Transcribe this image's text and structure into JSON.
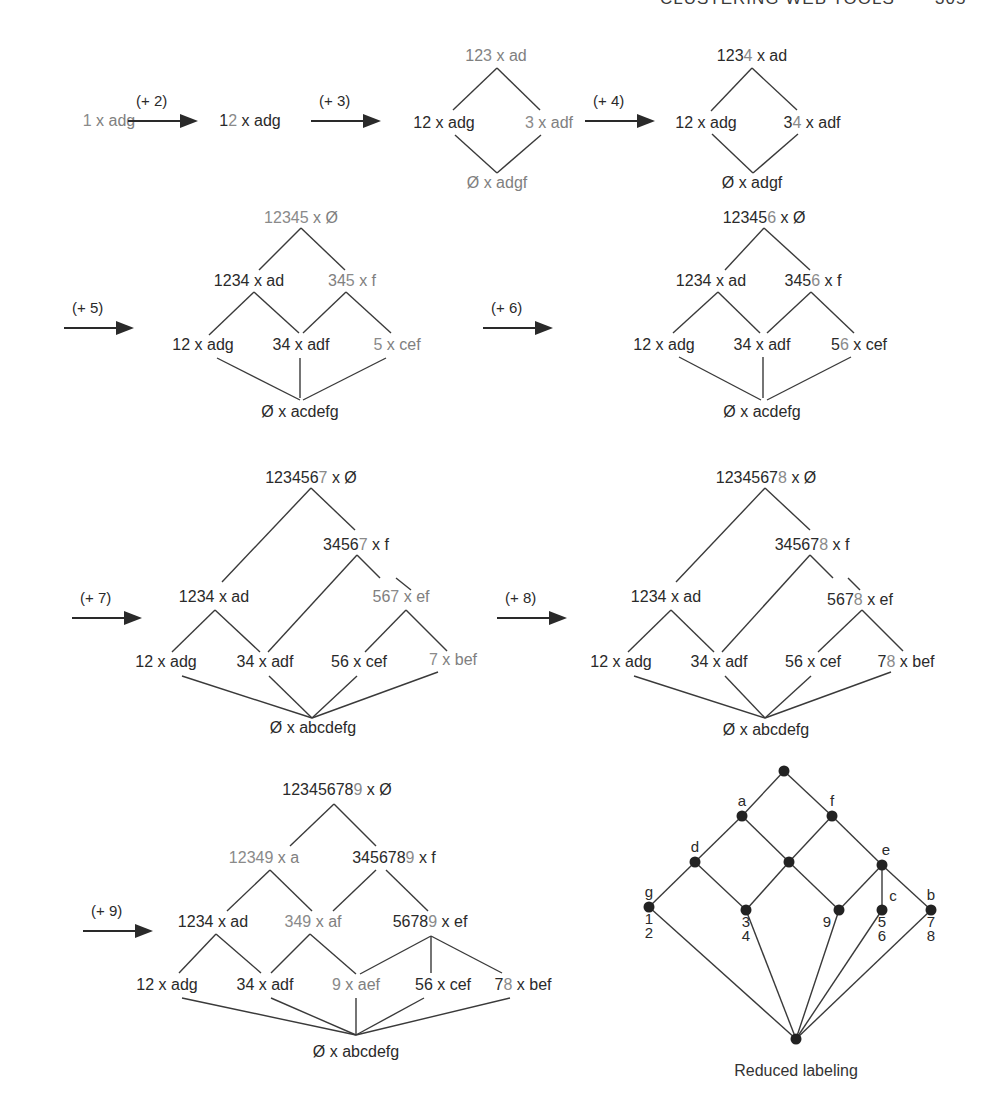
{
  "running_head": {
    "title": "CLUSTERING WEB TOOLS",
    "page": "305"
  },
  "steps": [
    {
      "id": "s1",
      "arrow": null,
      "nodes": [
        {
          "id": "n1",
          "pre": "",
          "new": "1",
          "post": " x adg",
          "x": 109,
          "y": 121,
          "gray": true
        }
      ],
      "edges": []
    },
    {
      "id": "s2",
      "arrow": {
        "label": "(+ 2)",
        "x": 128,
        "y": 111,
        "w": 70
      },
      "nodes": [
        {
          "id": "n1",
          "pre": "1",
          "new": "2",
          "post": " x adg",
          "x": 250,
          "y": 121
        }
      ],
      "edges": []
    },
    {
      "id": "s3",
      "arrow": {
        "label": "(+ 3)",
        "x": 311,
        "y": 111,
        "w": 70
      },
      "nodes": [
        {
          "id": "top",
          "pre": "12",
          "new": "3",
          "post": " x ad",
          "x": 496,
          "y": 56,
          "gray": true
        },
        {
          "id": "l",
          "pre": "",
          "new": "",
          "post": "12 x adg",
          "x": 444,
          "y": 123
        },
        {
          "id": "r",
          "pre": "",
          "new": "3",
          "post": " x adf",
          "x": 549,
          "y": 123,
          "gray": true
        },
        {
          "id": "bot",
          "pre": "",
          "new": "",
          "post": "Ø x adgf",
          "x": 497,
          "y": 183,
          "gray": true
        }
      ],
      "edges": [
        [
          453,
          110,
          497,
          68
        ],
        [
          497,
          68,
          540,
          110
        ],
        [
          455,
          135,
          497,
          173
        ],
        [
          497,
          173,
          541,
          135
        ]
      ]
    },
    {
      "id": "s4",
      "arrow": {
        "label": "(+ 4)",
        "x": 585,
        "y": 111,
        "w": 70
      },
      "nodes": [
        {
          "id": "top",
          "pre": "123",
          "new": "4",
          "post": " x ad",
          "x": 752,
          "y": 56
        },
        {
          "id": "l",
          "pre": "",
          "new": "",
          "post": "12 x adg",
          "x": 706,
          "y": 123
        },
        {
          "id": "r",
          "pre": "3",
          "new": "4",
          "post": " x adf",
          "x": 812,
          "y": 123
        },
        {
          "id": "bot",
          "pre": "",
          "new": "",
          "post": "Ø x adgf",
          "x": 752,
          "y": 183
        }
      ],
      "edges": [
        [
          711,
          111,
          752,
          68
        ],
        [
          752,
          68,
          797,
          110
        ],
        [
          712,
          134,
          753,
          173
        ],
        [
          753,
          173,
          798,
          134
        ]
      ]
    },
    {
      "id": "s5",
      "arrow": {
        "label": "(+ 5)",
        "x": 64,
        "y": 318,
        "w": 70
      },
      "nodes": [
        {
          "id": "top",
          "pre": "",
          "new": "12345",
          "post": " x Ø",
          "x": 301,
          "y": 218,
          "gray": true
        },
        {
          "id": "m1",
          "pre": "",
          "new": "",
          "post": "1234 x ad",
          "x": 249,
          "y": 281
        },
        {
          "id": "m2",
          "pre": "34",
          "new": "5",
          "post": " x f",
          "x": 352,
          "y": 281,
          "gray": true
        },
        {
          "id": "b1",
          "pre": "",
          "new": "",
          "post": "12 x adg",
          "x": 203,
          "y": 345
        },
        {
          "id": "b2",
          "pre": "",
          "new": "",
          "post": "34 x adf",
          "x": 301,
          "y": 345
        },
        {
          "id": "b3",
          "pre": "",
          "new": "5",
          "post": " x cef",
          "x": 397,
          "y": 345,
          "gray": true
        },
        {
          "id": "bot",
          "pre": "",
          "new": "",
          "post": "Ø x acdefg",
          "x": 300,
          "y": 412
        }
      ],
      "edges": [
        [
          259,
          270,
          301,
          228
        ],
        [
          301,
          228,
          345,
          270
        ],
        [
          209,
          335,
          254,
          292
        ],
        [
          254,
          292,
          299,
          333
        ],
        [
          303,
          333,
          346,
          292
        ],
        [
          346,
          292,
          391,
          333
        ],
        [
          217,
          358,
          300,
          400
        ],
        [
          300,
          358,
          300,
          398
        ],
        [
          303,
          400,
          386,
          358
        ]
      ]
    },
    {
      "id": "s6",
      "arrow": {
        "label": "(+ 6)",
        "x": 483,
        "y": 318,
        "w": 70
      },
      "nodes": [
        {
          "id": "top",
          "pre": "12345",
          "new": "6",
          "post": " x Ø",
          "x": 764,
          "y": 218
        },
        {
          "id": "m1",
          "pre": "",
          "new": "",
          "post": "1234 x ad",
          "x": 711,
          "y": 281
        },
        {
          "id": "m2",
          "pre": "345",
          "new": "6",
          "post": " x f",
          "x": 813,
          "y": 281
        },
        {
          "id": "b1",
          "pre": "",
          "new": "",
          "post": "12 x adg",
          "x": 664,
          "y": 345
        },
        {
          "id": "b2",
          "pre": "",
          "new": "",
          "post": "34 x adf",
          "x": 762,
          "y": 345
        },
        {
          "id": "b3",
          "pre": "5",
          "new": "6",
          "post": " x cef",
          "x": 859,
          "y": 345
        },
        {
          "id": "bot",
          "pre": "",
          "new": "",
          "post": "Ø x acdefg",
          "x": 762,
          "y": 412
        }
      ],
      "edges": [
        [
          725,
          270,
          764,
          228
        ],
        [
          764,
          228,
          810,
          270
        ],
        [
          673,
          333,
          718,
          292
        ],
        [
          718,
          292,
          760,
          333
        ],
        [
          767,
          333,
          811,
          292
        ],
        [
          811,
          292,
          854,
          333
        ],
        [
          679,
          357,
          761,
          400
        ],
        [
          763,
          357,
          763,
          398
        ],
        [
          767,
          400,
          851,
          357
        ]
      ]
    },
    {
      "id": "s7",
      "arrow": {
        "label": "(+ 7)",
        "x": 72,
        "y": 608,
        "w": 70
      },
      "nodes": [
        {
          "id": "top",
          "pre": "123456",
          "new": "7",
          "post": " x Ø",
          "x": 311,
          "y": 478
        },
        {
          "id": "m2",
          "pre": "3456",
          "new": "7",
          "post": " x f",
          "x": 356,
          "y": 545
        },
        {
          "id": "m1",
          "pre": "",
          "new": "",
          "post": "1234 x ad",
          "x": 214,
          "y": 597
        },
        {
          "id": "m3",
          "pre": "56",
          "new": "7",
          "post": " x ef",
          "x": 401,
          "y": 597,
          "gray": true
        },
        {
          "id": "b1",
          "pre": "",
          "new": "",
          "post": "12 x adg",
          "x": 166,
          "y": 662
        },
        {
          "id": "b2",
          "pre": "",
          "new": "",
          "post": "34 x adf",
          "x": 265,
          "y": 662
        },
        {
          "id": "b3",
          "pre": "",
          "new": "",
          "post": "56 x cef",
          "x": 359,
          "y": 662
        },
        {
          "id": "b4",
          "pre": "",
          "new": "7",
          "post": " x bef",
          "x": 453,
          "y": 660,
          "gray": true
        },
        {
          "id": "bot",
          "pre": "",
          "new": "",
          "post": "Ø x abcdefg",
          "x": 313,
          "y": 728
        }
      ],
      "edges": [
        [
          222,
          582,
          311,
          488
        ],
        [
          311,
          488,
          355,
          530
        ],
        [
          357,
          555,
          268,
          652
        ],
        [
          357,
          555,
          380,
          578
        ],
        [
          396,
          578,
          411,
          590
        ],
        [
          215,
          610,
          172,
          652
        ],
        [
          215,
          610,
          260,
          652
        ],
        [
          406,
          610,
          365,
          652
        ],
        [
          406,
          610,
          447,
          651
        ],
        [
          182,
          676,
          312,
          718
        ],
        [
          269,
          676,
          312,
          718
        ],
        [
          357,
          676,
          312,
          718
        ],
        [
          438,
          672,
          312,
          718
        ]
      ]
    },
    {
      "id": "s8",
      "arrow": {
        "label": "(+ 8)",
        "x": 497,
        "y": 608,
        "w": 70
      },
      "nodes": [
        {
          "id": "top",
          "pre": "1234567",
          "new": "8",
          "post": " x Ø",
          "x": 766,
          "y": 478
        },
        {
          "id": "m2",
          "pre": "34567",
          "new": "8",
          "post": " x f",
          "x": 812,
          "y": 545
        },
        {
          "id": "m1",
          "pre": "",
          "new": "",
          "post": "1234 x ad",
          "x": 666,
          "y": 597
        },
        {
          "id": "m3",
          "pre": "567",
          "new": "8",
          "post": " x ef",
          "x": 860,
          "y": 600
        },
        {
          "id": "b1",
          "pre": "",
          "new": "",
          "post": "12 x adg",
          "x": 621,
          "y": 662
        },
        {
          "id": "b2",
          "pre": "",
          "new": "",
          "post": "34 x adf",
          "x": 719,
          "y": 662
        },
        {
          "id": "b3",
          "pre": "",
          "new": "",
          "post": "56 x cef",
          "x": 813,
          "y": 662
        },
        {
          "id": "b4",
          "pre": "7",
          "new": "8",
          "post": " x bef",
          "x": 906,
          "y": 662
        },
        {
          "id": "bot",
          "pre": "",
          "new": "",
          "post": "Ø x abcdefg",
          "x": 766,
          "y": 730
        }
      ],
      "edges": [
        [
          676,
          582,
          765,
          488
        ],
        [
          765,
          488,
          810,
          530
        ],
        [
          810,
          555,
          722,
          652
        ],
        [
          810,
          555,
          833,
          578
        ],
        [
          848,
          578,
          860,
          590
        ],
        [
          671,
          610,
          628,
          652
        ],
        [
          671,
          610,
          714,
          652
        ],
        [
          862,
          610,
          818,
          652
        ],
        [
          862,
          610,
          903,
          651
        ],
        [
          634,
          676,
          765,
          718
        ],
        [
          725,
          676,
          765,
          718
        ],
        [
          811,
          676,
          765,
          718
        ],
        [
          891,
          672,
          765,
          718
        ]
      ]
    },
    {
      "id": "s9",
      "arrow": {
        "label": "(+ 9)",
        "x": 83,
        "y": 921,
        "w": 70
      },
      "nodes": [
        {
          "id": "top",
          "pre": "12345678",
          "new": "9",
          "post": " x Ø",
          "x": 337,
          "y": 790
        },
        {
          "id": "m1",
          "pre": "",
          "new": "12349",
          "post": " x a",
          "x": 264,
          "y": 858,
          "gray": true
        },
        {
          "id": "m2",
          "pre": "345678",
          "new": "9",
          "post": " x f",
          "x": 394,
          "y": 858
        },
        {
          "id": "l1",
          "pre": "",
          "new": "",
          "post": "1234 x ad",
          "x": 213,
          "y": 922
        },
        {
          "id": "l2",
          "pre": "",
          "new": "349",
          "post": " x af",
          "x": 313,
          "y": 922,
          "gray": true
        },
        {
          "id": "l3",
          "pre": "5678",
          "new": "9",
          "post": " x ef",
          "x": 430,
          "y": 922
        },
        {
          "id": "b1",
          "pre": "",
          "new": "",
          "post": "12 x adg",
          "x": 167,
          "y": 985
        },
        {
          "id": "b2",
          "pre": "",
          "new": "",
          "post": "34 x adf",
          "x": 265,
          "y": 985
        },
        {
          "id": "b3",
          "pre": "",
          "new": "9",
          "post": " x aef",
          "x": 356,
          "y": 985,
          "gray": true
        },
        {
          "id": "b4",
          "pre": "",
          "new": "",
          "post": "56 x cef",
          "x": 443,
          "y": 985
        },
        {
          "id": "b5",
          "pre": "7",
          "new": "8",
          "post": " x bef",
          "x": 523,
          "y": 985,
          "gray_override": false
        },
        {
          "id": "bot",
          "pre": "",
          "new": "",
          "post": "Ø x abcdefg",
          "x": 356,
          "y": 1052
        }
      ],
      "edges": [
        [
          290,
          846,
          334,
          804
        ],
        [
          334,
          804,
          376,
          846
        ],
        [
          227,
          911,
          270,
          870
        ],
        [
          270,
          870,
          312,
          911
        ],
        [
          333,
          911,
          376,
          870
        ],
        [
          386,
          870,
          428,
          911
        ],
        [
          179,
          973,
          216,
          934
        ],
        [
          216,
          934,
          261,
          973
        ],
        [
          271,
          973,
          310,
          934
        ],
        [
          310,
          934,
          356,
          974
        ],
        [
          360,
          974,
          431,
          936
        ],
        [
          431,
          936,
          431,
          973
        ],
        [
          431,
          936,
          502,
          973
        ],
        [
          182,
          998,
          356,
          1035
        ],
        [
          271,
          998,
          356,
          1035
        ],
        [
          356,
          998,
          356,
          1035
        ],
        [
          424,
          998,
          356,
          1035
        ],
        [
          510,
          998,
          356,
          1035
        ]
      ]
    }
  ],
  "reduced_labeling": {
    "caption": "Reduced labeling",
    "nodes": [
      {
        "id": "top",
        "x": 784,
        "y": 771,
        "label_above": "",
        "label_below": ""
      },
      {
        "id": "a",
        "x": 742,
        "y": 816,
        "label_above": "a",
        "label_below": ""
      },
      {
        "id": "f",
        "x": 832,
        "y": 816,
        "label_above": "f",
        "label_below": ""
      },
      {
        "id": "d",
        "x": 695,
        "y": 862,
        "label_above": "d",
        "label_below": ""
      },
      {
        "id": "mid",
        "x": 789,
        "y": 862,
        "label_above": "",
        "label_below": ""
      },
      {
        "id": "e",
        "x": 882,
        "y": 865,
        "label_above": "e",
        "label_below": ""
      },
      {
        "id": "g",
        "x": 649,
        "y": 907,
        "label_above": "g",
        "label_below": "1\n2"
      },
      {
        "id": "n34",
        "x": 746,
        "y": 910,
        "label_above": "",
        "label_below": "3\n4"
      },
      {
        "id": "n9",
        "x": 839,
        "y": 910,
        "label_above": "",
        "label_below": "9"
      },
      {
        "id": "c",
        "x": 882,
        "y": 910,
        "label_above": "c",
        "label_below": "5\n6"
      },
      {
        "id": "b",
        "x": 931,
        "y": 910,
        "label_above": "b",
        "label_below": "7\n8"
      },
      {
        "id": "bottom",
        "x": 796,
        "y": 1039,
        "label_above": "",
        "label_below": ""
      }
    ],
    "edges": [
      [
        "top",
        "a"
      ],
      [
        "top",
        "f"
      ],
      [
        "a",
        "d"
      ],
      [
        "a",
        "mid"
      ],
      [
        "f",
        "mid"
      ],
      [
        "f",
        "e"
      ],
      [
        "d",
        "g"
      ],
      [
        "d",
        "n34"
      ],
      [
        "mid",
        "n34"
      ],
      [
        "mid",
        "n9"
      ],
      [
        "e",
        "n9"
      ],
      [
        "e",
        "c"
      ],
      [
        "e",
        "b"
      ],
      [
        "g",
        "bottom"
      ],
      [
        "n34",
        "bottom"
      ],
      [
        "n9",
        "bottom"
      ],
      [
        "c",
        "bottom"
      ],
      [
        "b",
        "bottom"
      ]
    ]
  }
}
